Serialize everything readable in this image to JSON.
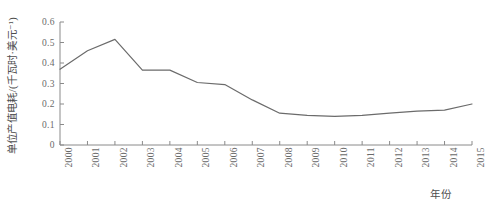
{
  "chart_data": {
    "type": "line",
    "title": "",
    "xlabel": "年份",
    "ylabel": "单位产值电耗/(千瓦时·美元⁻¹)",
    "categories": [
      "2000",
      "2001",
      "2002",
      "2003",
      "2004",
      "2005",
      "2006",
      "2007",
      "2008",
      "2009",
      "2010",
      "2011",
      "2012",
      "2013",
      "2014",
      "2015"
    ],
    "values": [
      0.37,
      0.46,
      0.515,
      0.365,
      0.365,
      0.305,
      0.295,
      0.22,
      0.155,
      0.145,
      0.14,
      0.145,
      0.155,
      0.165,
      0.17,
      0.2
    ],
    "series": [
      {
        "name": "单位产值电耗",
        "values": [
          0.37,
          0.46,
          0.515,
          0.365,
          0.365,
          0.305,
          0.295,
          0.22,
          0.155,
          0.145,
          0.14,
          0.145,
          0.155,
          0.165,
          0.17,
          0.2
        ]
      }
    ],
    "ylim": [
      0,
      0.6
    ],
    "yticks": [
      0,
      0.1,
      0.2,
      0.3,
      0.4,
      0.5,
      0.6
    ],
    "ytick_labels": [
      "0",
      "0.1",
      "0.2",
      "0.3",
      "0.4",
      "0.5",
      "0.6"
    ],
    "xlim": [
      "2000",
      "2015"
    ],
    "grid": false,
    "legend": false,
    "legend_position": "none",
    "line_color": "#6b6b6b",
    "axis_color": "#8a8a8a"
  }
}
